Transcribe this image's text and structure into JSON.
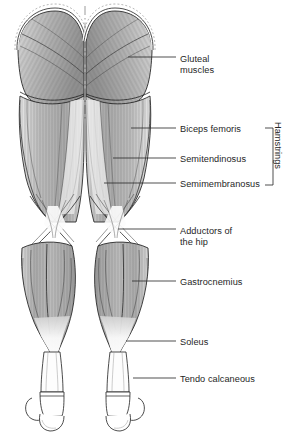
{
  "figure": {
    "view": "posterior",
    "background_color": "#ffffff",
    "line_color": "#1a1a1a",
    "text_color": "#262626",
    "muscle_fill_light": "#f2f2f2",
    "muscle_fill_mid": "#c9c9c9",
    "muscle_fill_dark": "#9a9a9a",
    "tendon_fill": "#fbfbfb",
    "midline_style": "dash-dot"
  },
  "labels": [
    {
      "id": "gluteal",
      "text_line1": "Gluteal",
      "text_line2": "muscles",
      "text_x": 180,
      "text_y": 54,
      "leader_x1": 128,
      "leader_y1": 57,
      "leader_x2": 176,
      "leader_y2": 57
    },
    {
      "id": "biceps-femoris",
      "text_line1": "Biceps femoris",
      "text_line2": "",
      "text_x": 180,
      "text_y": 124,
      "leader_x1": 131,
      "leader_y1": 128,
      "leader_x2": 176,
      "leader_y2": 128
    },
    {
      "id": "semitendinosus",
      "text_line1": "Semitendinosus",
      "text_line2": "",
      "text_x": 180,
      "text_y": 154,
      "leader_x1": 113,
      "leader_y1": 158,
      "leader_x2": 176,
      "leader_y2": 158
    },
    {
      "id": "semimembranosus",
      "text_line1": "Semimembranosus",
      "text_line2": "",
      "text_x": 180,
      "text_y": 179,
      "leader_x1": 104,
      "leader_y1": 183,
      "leader_x2": 176,
      "leader_y2": 183
    },
    {
      "id": "adductors",
      "text_line1": "Adductors of",
      "text_line2": "the hip",
      "text_x": 180,
      "text_y": 226,
      "leader_x1": 118,
      "leader_y1": 229,
      "leader_x2": 176,
      "leader_y2": 229
    },
    {
      "id": "gastrocnemius",
      "text_line1": "Gastrocnemius",
      "text_line2": "",
      "text_x": 180,
      "text_y": 277,
      "leader_x1": 132,
      "leader_y1": 281,
      "leader_x2": 176,
      "leader_y2": 281
    },
    {
      "id": "soleus",
      "text_line1": "Soleus",
      "text_line2": "",
      "text_x": 180,
      "text_y": 337,
      "leader_x1": 126,
      "leader_y1": 341,
      "leader_x2": 176,
      "leader_y2": 341
    },
    {
      "id": "tendo-calcaneous",
      "text_line1": "Tendo calcaneous",
      "text_line2": "",
      "text_x": 180,
      "text_y": 374,
      "leader_x1": 133,
      "leader_y1": 378,
      "leader_x2": 176,
      "leader_y2": 378
    }
  ],
  "group_bracket": {
    "label": "Hamstrings",
    "members": [
      "Biceps femoris",
      "Semitendinosus",
      "Semimembranosus"
    ],
    "x": 273,
    "y_top": 128,
    "y_bottom": 185,
    "text_x": 283,
    "text_y": 122
  }
}
